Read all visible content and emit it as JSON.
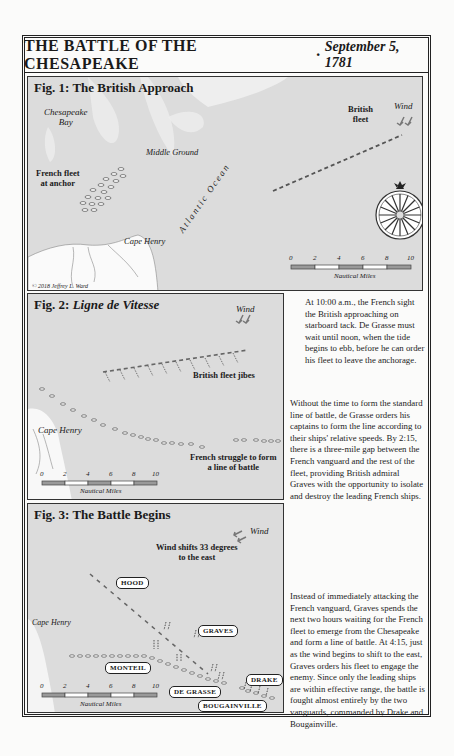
{
  "title": {
    "main": "THE BATTLE OF THE CHESAPEAKE",
    "separator": "·",
    "date": "September 5, 1781"
  },
  "fig1": {
    "title": "Fig. 1: The British Approach",
    "labels": {
      "chesapeake_bay": "Chesapeake\nBay",
      "middle_ground": "Middle Ground",
      "french_fleet": "French fleet\nat anchor",
      "cape_henry": "Cape Henry",
      "atlantic_ocean": "Atlantic Ocean",
      "british_fleet": "British\nfleet",
      "wind": "Wind",
      "copyright": "© 2018 Jeffrey L. Ward"
    },
    "scale": {
      "ticks": [
        "0",
        "2",
        "4",
        "6",
        "8",
        "10"
      ],
      "unit": "Nautical Miles"
    }
  },
  "fig2": {
    "title_prefix": "Fig. 2: ",
    "title_italic": "Ligne de Vitesse",
    "labels": {
      "wind": "Wind",
      "british_jibes": "British fleet jibes",
      "cape_henry": "Cape Henry",
      "french_struggle": "French struggle to form\na line of battle"
    },
    "scale": {
      "ticks": [
        "0",
        "2",
        "4",
        "6",
        "8",
        "10"
      ],
      "unit": "Nautical Miles"
    }
  },
  "fig3": {
    "title": "Fig. 3: The Battle Begins",
    "labels": {
      "wind": "Wind",
      "wind_shift": "Wind shifts 33 degrees\nto the east",
      "cape_henry": "Cape Henry"
    },
    "tags": {
      "hood": "HOOD",
      "graves": "GRAVES",
      "monteil": "MONTEIL",
      "de_grasse": "DE GRASSE",
      "drake": "DRAKE",
      "bougainville": "BOUGAINVILLE"
    },
    "scale": {
      "ticks": [
        "0",
        "2",
        "4",
        "6",
        "8",
        "10"
      ],
      "unit": "Nautical Miles"
    }
  },
  "text": {
    "p1": "At 10:00 a.m., the French sight the British approaching on starboard tack. De Grasse must wait until noon, when the tide begins to ebb, before he can order his fleet to leave the anchorage.",
    "p2": "Without the time to form the standard line of battle, de Grasse orders his captains to form the line according to their ships' relative speeds. By 2:15, there is a three-mile gap between the French vanguard and the rest of the fleet, providing British admiral Graves with the opportunity to isolate and destroy the leading French ships.",
    "p3": "Instead of immediately attacking the French vanguard, Graves spends the next two hours waiting for the French fleet to emerge from the Chesapeake and form a line of battle. At 4:15, just as the wind begins to shift to the east, Graves orders his fleet to engage the enemy. Since only the leading ships are within effective range, the battle is fought almost entirely by the two vanguards, commanded by Drake and Bougainville."
  }
}
